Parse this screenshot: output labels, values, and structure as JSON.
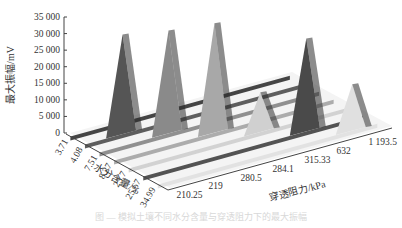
{
  "chart_data": {
    "type": "3d-bar-ribbon",
    "title": "",
    "zlabel": "最大振幅/mV",
    "xlabel": "穿透阻力/kPa",
    "ylabel": "水分含量/%",
    "z_ticks": [
      "0",
      "5 000",
      "10 000",
      "15 000",
      "20 000",
      "25 000",
      "30 000",
      "35 000"
    ],
    "zlim": [
      0,
      35000
    ],
    "x_categories": [
      "210.25",
      "219",
      "280.5",
      "284.1",
      "315.33",
      "632",
      "1 193.5"
    ],
    "y_categories": [
      "3.71",
      "4.08",
      "7.51",
      "8.27",
      "23.7",
      "25.67",
      "34.99"
    ],
    "series": [
      {
        "moisture": "3.71",
        "resistance": "210.25",
        "peak_value": 0,
        "color": "#3a3a3a"
      },
      {
        "moisture": "4.08",
        "resistance": "219",
        "peak_value": 30000,
        "color": "#555555"
      },
      {
        "moisture": "7.51",
        "resistance": "280.5",
        "peak_value": 31000,
        "color": "#8a8a8a"
      },
      {
        "moisture": "8.27",
        "resistance": "284.1",
        "peak_value": 33000,
        "color": "#a8a8a8"
      },
      {
        "moisture": "23.7",
        "resistance": "315.33",
        "peak_value": 12000,
        "color": "#d0d0d0"
      },
      {
        "moisture": "25.67",
        "resistance": "632",
        "peak_value": 28000,
        "color": "#4a4a4a"
      },
      {
        "moisture": "34.99",
        "resistance": "1 193.5",
        "peak_value": 14000,
        "color": "#e0e0e0"
      }
    ],
    "grid": false,
    "legend": "none"
  },
  "caption": "图 — 模拟土壤不同水分含量与穿透阻力下的最大振幅"
}
